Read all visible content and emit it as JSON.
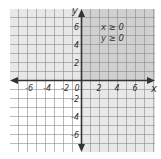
{
  "figure": {
    "type": "coordinate-plane-inequality",
    "inequalities": [
      "x ≥ 0",
      "y ≥ 0"
    ],
    "axes": {
      "x_label": "x",
      "y_label": "y",
      "x_ticks": [
        "-6",
        "-4",
        "-2",
        "0",
        "2",
        "4",
        "6"
      ],
      "y_ticks": [
        "6",
        "4",
        "2",
        "-2",
        "-4",
        "-6"
      ],
      "range": [
        -7,
        7
      ]
    },
    "shading": {
      "y_ge_0_region": "#e6e6e6",
      "x_ge_0_region": "#e6e6e6",
      "overlap_region": "#cfcfcf"
    },
    "colors": {
      "grid": "#8a8a8a",
      "axis": "#333333"
    }
  }
}
